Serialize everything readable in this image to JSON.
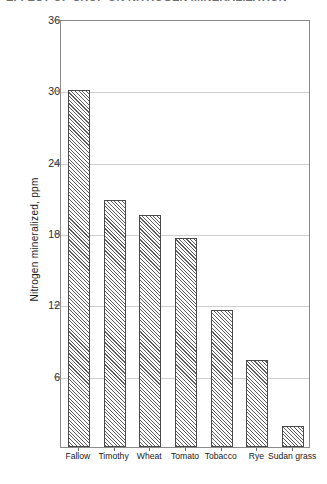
{
  "caption": {
    "clipped_heading": "EFFECT OF CROP ON NITROGEN MINERALIZATION"
  },
  "chart_data": {
    "type": "bar",
    "title": "",
    "xlabel": "",
    "ylabel": "Nitrogen mineralized, ppm",
    "categories": [
      "Fallow",
      "Timothy",
      "Wheat",
      "Tomato",
      "Tobacco",
      "Rye",
      "Sudan grass"
    ],
    "values": [
      30.0,
      20.8,
      19.5,
      17.6,
      11.5,
      7.3,
      1.8
    ],
    "ylim": [
      0,
      36
    ],
    "yticks": [
      6,
      12,
      18,
      24,
      30,
      36
    ],
    "ytick_labels": [
      "6",
      "12",
      "18",
      "24",
      "30",
      "36"
    ],
    "grid": true,
    "legend": "none",
    "bar_fill": "diagonal-hatch",
    "colors": {
      "bar_edge": "#4a4a4a",
      "bar_hatch": "#5e5e5e",
      "gridline": "#cfcfcf",
      "axis": "#8a8a8a",
      "text": "#1a1a1a"
    }
  }
}
